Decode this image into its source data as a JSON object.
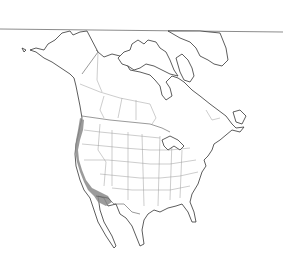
{
  "map": {
    "type": "range-map",
    "region": "North America",
    "projection_hint": "Lambert conic",
    "colors": {
      "background": "#ffffff",
      "coastline": "#333333",
      "state_borders": "#9a9a9a",
      "range_fill": "#8a8a8a",
      "header_rule": "#8c8c8c"
    },
    "highlighted_range": {
      "label": "Pacific coast range",
      "description": "Narrow coastal strip from southern British Columbia / Vancouver Island south through Washington, Oregon, California to northern Baja California"
    }
  }
}
